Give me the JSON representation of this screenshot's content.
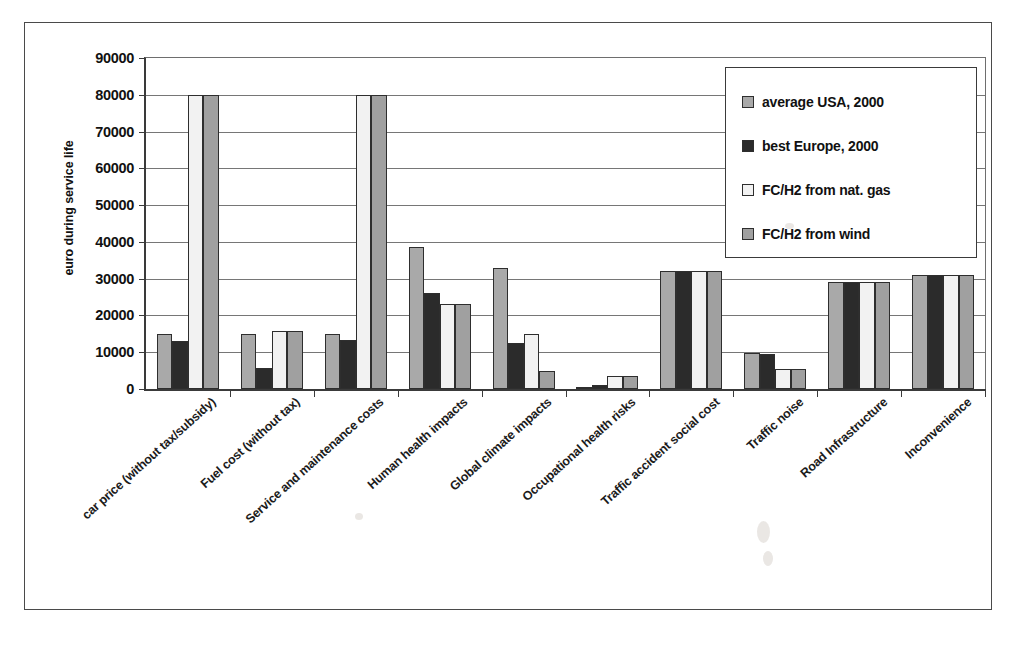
{
  "chart_data": {
    "type": "bar",
    "title": "",
    "xlabel": "",
    "ylabel": "euro during service life",
    "ylim": [
      0,
      90000
    ],
    "ytick_labels": [
      "90000",
      "80000",
      "70000",
      "60000",
      "50000",
      "40000",
      "30000",
      "20000",
      "10000",
      "0"
    ],
    "ytick_values": [
      90000,
      80000,
      70000,
      60000,
      50000,
      40000,
      30000,
      20000,
      10000,
      0
    ],
    "grid": true,
    "legend_position": "top-right",
    "clipped_note": "bars exceeding 80000 are drawn clipped at the 80000 gridline",
    "categories": [
      "car price (without tax/subsidy)",
      "Fuel cost (without tax)",
      "Service and maintenance costs",
      "Human health impacts",
      "Global climate impacts",
      "Occupational health risks",
      "Traffic accident social cost",
      "Traffic noise",
      "Road Infrastructure",
      "Inconvenience"
    ],
    "series": [
      {
        "name": "average USA, 2000",
        "color": "#a9a9a9",
        "values": [
          15000,
          15000,
          15000,
          38500,
          33000,
          300,
          32000,
          9800,
          29000,
          31000
        ]
      },
      {
        "name": "best Europe, 2000",
        "color": "#2b2b2b",
        "values": [
          13000,
          5700,
          13200,
          26000,
          12500,
          1000,
          32000,
          9500,
          29000,
          31000
        ]
      },
      {
        "name": "FC/H2 from nat. gas",
        "color": "#f2f2f2",
        "values": [
          80000,
          15800,
          80000,
          23000,
          15000,
          3500,
          32000,
          5500,
          29000,
          31000
        ]
      },
      {
        "name": "FC/H2 from wind",
        "color": "#a0a0a0",
        "values": [
          80000,
          15800,
          80000,
          23000,
          4800,
          3500,
          32000,
          5500,
          29000,
          31000
        ]
      }
    ]
  },
  "legend": {
    "items": [
      {
        "label": "average USA, 2000"
      },
      {
        "label": "best Europe, 2000"
      },
      {
        "label": "FC/H2 from nat. gas"
      },
      {
        "label": "FC/H2 from wind"
      }
    ]
  }
}
